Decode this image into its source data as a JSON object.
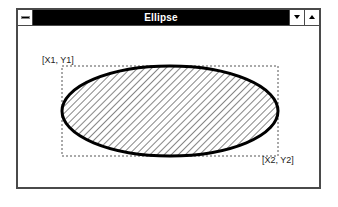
{
  "window": {
    "title": "Ellipse",
    "system_menu_icon": "system-menu-bar-icon",
    "minimize_icon": "triangle-down-icon",
    "maximize_icon": "triangle-up-icon"
  },
  "canvas": {
    "label_top_left": "[X1, Y1]",
    "label_bottom_right": "[X2, Y2]",
    "bounding_rect": {
      "x1": 62,
      "y1": 66,
      "x2": 278,
      "y2": 156,
      "style": "dotted"
    },
    "ellipse": {
      "fill": "diagonal-hatch",
      "stroke": "#000000",
      "stroke_width": 3
    }
  },
  "colors": {
    "titlebar": "#000000",
    "title_text": "#ffffff",
    "frame": "#4a4a4a",
    "background": "#ffffff"
  }
}
